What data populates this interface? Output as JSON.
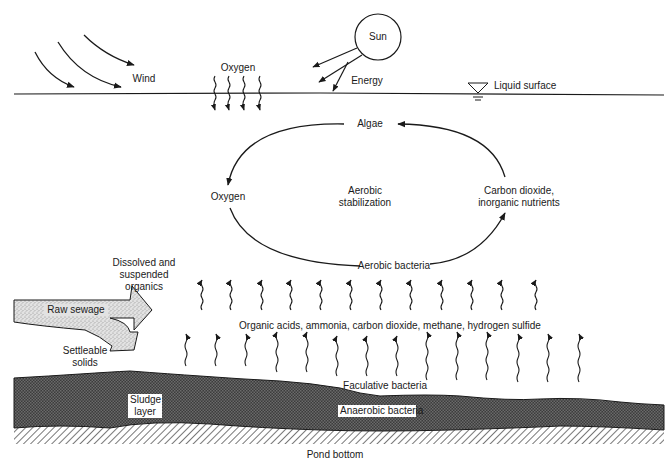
{
  "diagram": {
    "type": "facultative stabilization pond cross-section",
    "labels": {
      "sun": "Sun",
      "wind": "Wind",
      "oxygen_top": "Oxygen",
      "energy": "Energy",
      "liquid_surface": "Liquid surface",
      "algae": "Algae",
      "oxygen_cycle": "Oxygen",
      "aerobic_stabilization_1": "Aerobic",
      "aerobic_stabilization_2": "stabilization",
      "co2_1": "Carbon dioxide,",
      "co2_2": "inorganic nutrients",
      "aerobic_bacteria": "Aerobic bacteria",
      "dissolved_1": "Dissolved and",
      "dissolved_2": "suspended",
      "dissolved_3": "organics",
      "raw_sewage": "Raw sewage",
      "settleable_1": "Settleable",
      "settleable_2": "solids",
      "gases": "Organic acids, ammonia, carbon dioxide, methane, hydrogen sulfide",
      "facultative_bacteria": "Faculative bacteria",
      "sludge_1": "Sludge",
      "sludge_2": "layer",
      "anaerobic_bacteria": "Anaerobic bacteria",
      "pond_bottom": "Pond bottom"
    },
    "cycle": [
      "Algae",
      "Oxygen",
      "Aerobic bacteria",
      "Carbon dioxide, inorganic nutrients"
    ],
    "colors": {
      "line": "#1a1a1a",
      "sludge": "#4a4a4a",
      "sewage_arrow": "#d0d0d0",
      "hatch": "#555555"
    }
  }
}
